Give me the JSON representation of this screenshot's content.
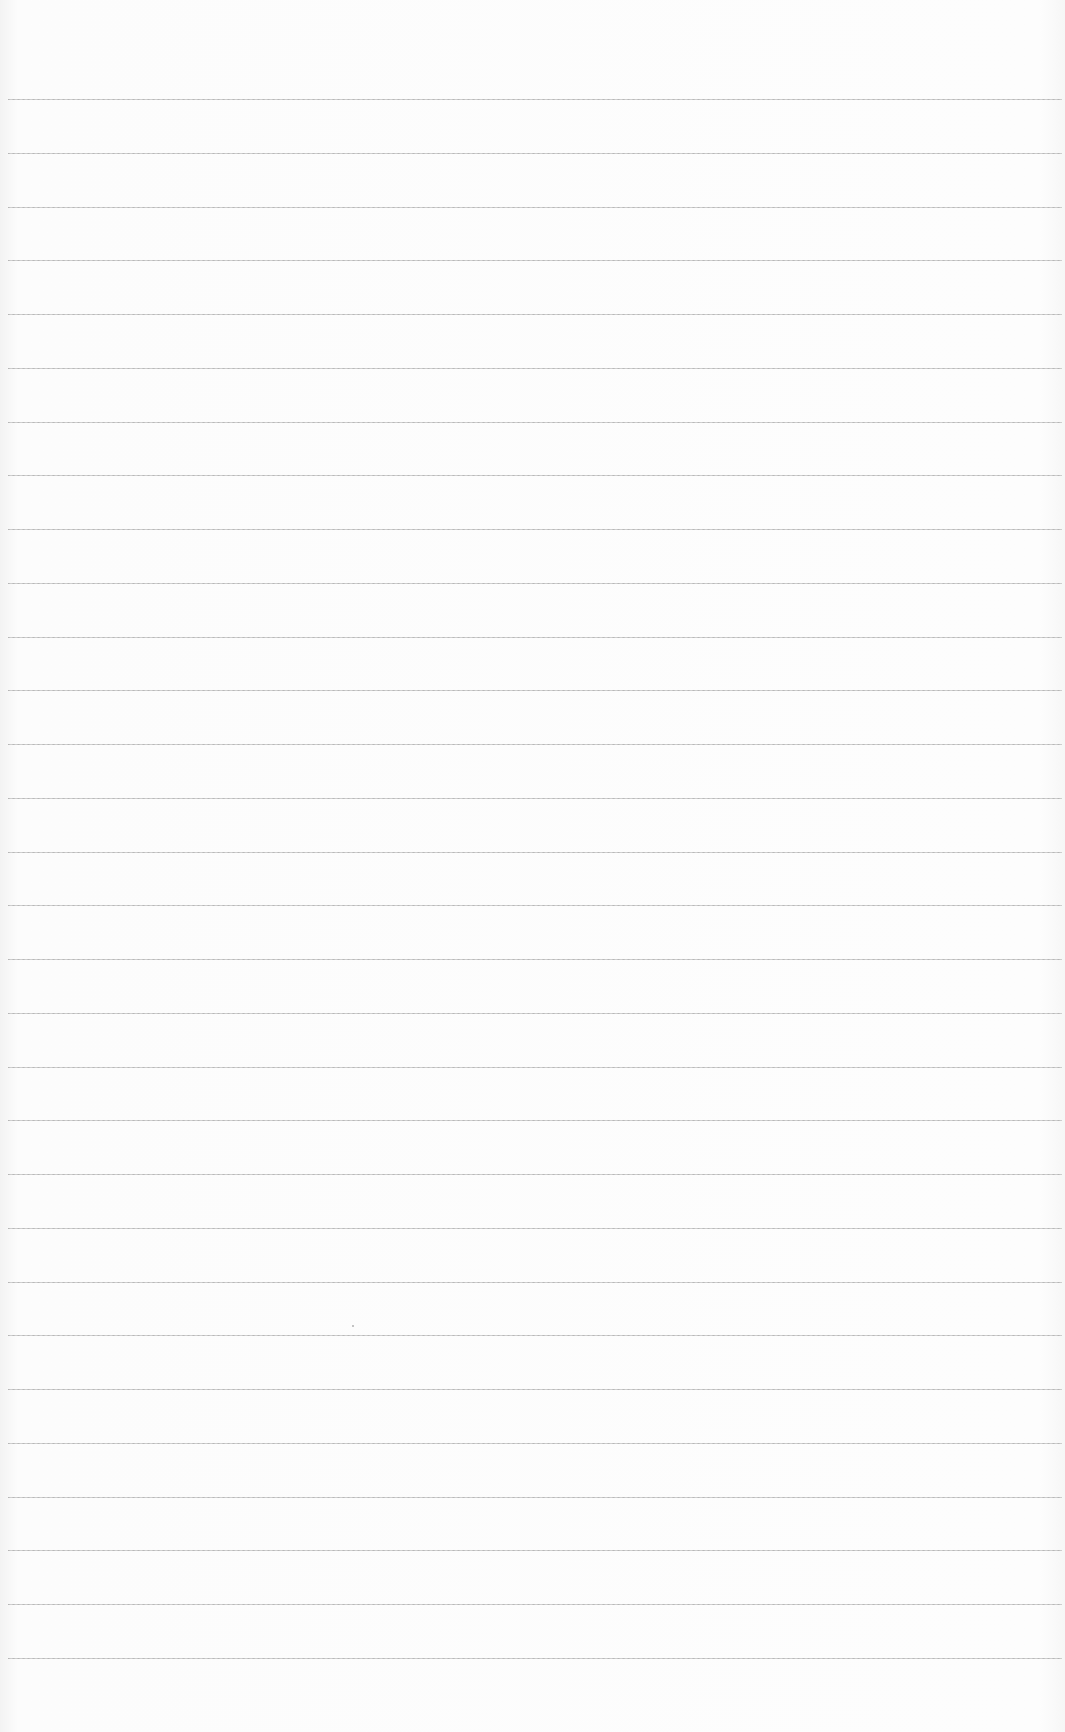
{
  "page": {
    "type": "ruled-paper",
    "background_color": "#fbfbfb",
    "line_color": "#a8a8a8",
    "line_count": 30,
    "first_line_y": 99,
    "line_spacing": 53.75,
    "line_left": 8,
    "line_right": 1062
  },
  "bleed_through": {
    "top": "",
    "bottom": ""
  },
  "marks": [
    {
      "x": 352,
      "y": 1325
    }
  ]
}
